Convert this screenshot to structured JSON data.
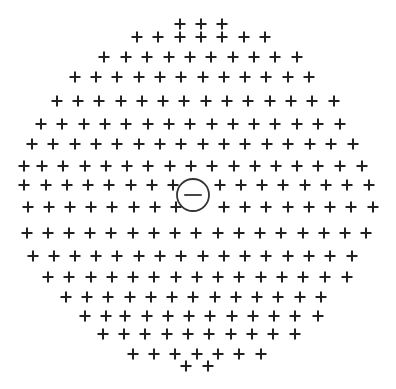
{
  "diagram": {
    "positive_symbol": "+",
    "negative_symbol": "−",
    "colors": {
      "background": "#ffffff",
      "plus": "#222222",
      "electron_stroke": "#333333"
    },
    "plus_size": 11,
    "rows": [
      {
        "y": 24,
        "x": [
          180,
          201,
          222
        ]
      },
      {
        "y": 37,
        "x": [
          137,
          158,
          180,
          201,
          222,
          244,
          265
        ]
      },
      {
        "y": 57,
        "x": [
          104,
          126,
          147,
          169,
          190,
          211,
          233,
          254,
          275,
          297
        ]
      },
      {
        "y": 77,
        "x": [
          75,
          96,
          117,
          139,
          160,
          181,
          203,
          224,
          245,
          266,
          288,
          309
        ]
      },
      {
        "y": 101,
        "x": [
          57,
          78,
          99,
          121,
          142,
          163,
          184,
          206,
          227,
          248,
          270,
          291,
          312,
          334
        ]
      },
      {
        "y": 124,
        "x": [
          41,
          62,
          84,
          105,
          126,
          148,
          169,
          190,
          212,
          233,
          254,
          275,
          297,
          318,
          340
        ]
      },
      {
        "y": 144,
        "x": [
          32,
          53,
          75,
          96,
          117,
          139,
          160,
          181,
          203,
          224,
          245,
          267,
          288,
          310,
          331,
          353
        ]
      },
      {
        "y": 166,
        "x": [
          24,
          42,
          63,
          85,
          106,
          127,
          148,
          170,
          191,
          212,
          234,
          255,
          276,
          297,
          318,
          340,
          362
        ]
      },
      {
        "y": 185,
        "x": [
          24,
          46,
          67,
          88,
          109,
          131,
          152,
          173,
          220,
          241,
          262,
          283,
          305,
          326,
          347,
          369
        ]
      },
      {
        "y": 207,
        "x": [
          28,
          49,
          70,
          91,
          112,
          134,
          155,
          176,
          224,
          245,
          266,
          288,
          309,
          330,
          351,
          373
        ]
      },
      {
        "y": 233,
        "x": [
          27,
          48,
          69,
          90,
          111,
          133,
          154,
          175,
          196,
          218,
          239,
          260,
          281,
          303,
          324,
          345,
          366
        ]
      },
      {
        "y": 256,
        "x": [
          33,
          54,
          75,
          96,
          117,
          139,
          160,
          181,
          203,
          224,
          245,
          266,
          288,
          309,
          330,
          352
        ]
      },
      {
        "y": 277,
        "x": [
          48,
          69,
          91,
          112,
          133,
          154,
          176,
          197,
          218,
          239,
          261,
          282,
          303,
          325,
          347
        ]
      },
      {
        "y": 297,
        "x": [
          66,
          87,
          108,
          130,
          151,
          172,
          193,
          215,
          236,
          257,
          278,
          300,
          321
        ]
      },
      {
        "y": 316,
        "x": [
          85,
          106,
          125,
          147,
          168,
          189,
          210,
          232,
          253,
          274,
          295,
          318
        ]
      },
      {
        "y": 334,
        "x": [
          103,
          124,
          145,
          167,
          188,
          209,
          231,
          252,
          273,
          295
        ]
      },
      {
        "y": 354,
        "x": [
          133,
          154,
          175,
          197,
          218,
          239,
          261
        ]
      },
      {
        "y": 366,
        "x": [
          186,
          208
        ]
      }
    ],
    "electron": {
      "cx": 193,
      "cy": 195,
      "r": 16,
      "label": "−"
    }
  }
}
